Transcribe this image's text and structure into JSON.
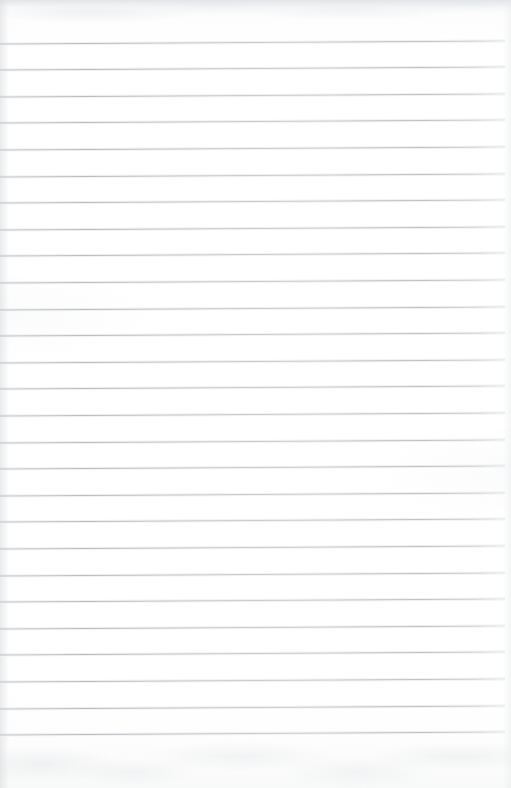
{
  "document": {
    "kind": "scanned-lined-paper",
    "title": "Blank Ruled Notepad Page",
    "has_text_content": false,
    "has_handwriting": false,
    "visible_text": "",
    "page_width_px": 511,
    "page_height_px": 788
  },
  "paper": {
    "background_color": "#fdfdfd",
    "highlight_color": "#ffffff",
    "top_edge_shadow_color": "#dde0e3",
    "bottom_texture_color": "#e6e9eb",
    "left_edge_shadow_color": "#d6dadd"
  },
  "ruling": {
    "line_color": "#b7bcc1",
    "line_thickness_px": 1,
    "line_count": 27,
    "first_line_y": 43,
    "spacing_px": 26.6,
    "left_inset_px": 0,
    "right_inset_px": 6,
    "skew_degrees": -0.33,
    "top_margin_px": 43,
    "bottom_margin_px": 52,
    "line_positions_y": [
      43,
      69.6,
      96.2,
      122.8,
      149.4,
      176,
      202.6,
      229.2,
      255.8,
      282.4,
      309,
      335.6,
      362.2,
      388.8,
      415.4,
      442,
      468.6,
      495.2,
      521.8,
      548.4,
      575,
      601.6,
      628.2,
      654.8,
      681.4,
      708,
      734.6
    ]
  }
}
